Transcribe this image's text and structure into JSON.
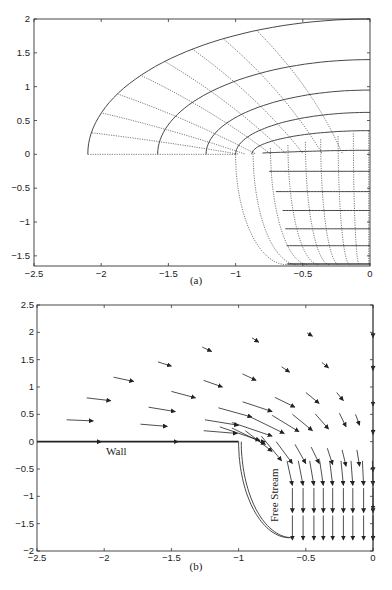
{
  "chart_data": [
    {
      "id": "a",
      "type": "line",
      "title": "",
      "caption": "(a)",
      "xlabel": "",
      "ylabel": "",
      "xlim": [
        -2.5,
        0
      ],
      "ylim": [
        -1.65,
        2
      ],
      "x_ticks": [
        "-2.5",
        "-2",
        "-1.5",
        "-1",
        "-0.5",
        "0"
      ],
      "y_ticks": [
        "-1.5",
        "-1",
        "-0.5",
        "0",
        "0.5",
        "1",
        "1.5",
        "2"
      ],
      "grid": false,
      "description": "Curvilinear orthogonal mesh: solid lines are streamlines (constant psi), dotted lines are equipotentials (constant phi)",
      "solid_curves": [
        {
          "start": [
            -2.1,
            0
          ],
          "end_y_at_x0": 2.0
        },
        {
          "start": [
            -1.58,
            0
          ],
          "end_y_at_x0": 1.4
        },
        {
          "start": [
            -1.22,
            0
          ],
          "end_y_at_x0": 0.95
        },
        {
          "start": [
            -1.0,
            0
          ],
          "end_y_at_x0": 0.62
        },
        {
          "start": [
            -0.88,
            0
          ],
          "end_y_at_x0": 0.35
        },
        {
          "start": [
            -0.8,
            -0.02
          ],
          "end_y_at_x0": 0.02
        },
        {
          "start": [
            -0.75,
            -0.25
          ],
          "end_y_at_x0": -0.25
        },
        {
          "start": [
            -0.7,
            -0.55
          ],
          "end_y_at_x0": -0.55
        },
        {
          "start": [
            -0.65,
            -0.83
          ],
          "end_y_at_x0": -0.83
        },
        {
          "start": [
            -0.63,
            -1.1
          ],
          "end_y_at_x0": -1.1
        },
        {
          "start": [
            -0.62,
            -1.35
          ],
          "end_y_at_x0": -1.35
        },
        {
          "start": [
            -0.61,
            -1.62
          ],
          "end_y_at_x0": -1.62
        }
      ],
      "dotted_curves_bottom_x": [
        -0.62,
        -0.54,
        -0.46,
        -0.38,
        -0.3,
        -0.23,
        -0.15,
        -0.08,
        -0.01
      ],
      "dotted_rays_angle_deg": [
        0,
        15,
        30,
        45,
        60
      ]
    },
    {
      "id": "b",
      "type": "scatter",
      "subtype": "quiver",
      "title": "",
      "caption": "(b)",
      "xlabel": "",
      "ylabel": "",
      "xlim": [
        -2.5,
        0
      ],
      "ylim": [
        -2,
        2.5
      ],
      "x_ticks": [
        "-2.5",
        "-2",
        "-1.5",
        "-1",
        "-0.5",
        "0"
      ],
      "y_ticks": [
        "-2",
        "-1.5",
        "-1",
        "-0.5",
        "0",
        "0.5",
        "1",
        "1.5",
        "2",
        "2.5"
      ],
      "grid": false,
      "annotations": [
        {
          "text": "Wall",
          "x": -2.05,
          "y": -0.15,
          "rotation": 0
        },
        {
          "text": "Free Stream",
          "x": -0.72,
          "y": -1.2,
          "rotation": -90
        }
      ],
      "wall_line": {
        "x": [
          -2.5,
          -1.0
        ],
        "y": [
          0,
          0
        ]
      },
      "free_stream_curve": "quarter curve from (-1.0, 0) bending down to (-0.62, -1.85)",
      "arrows": [
        {
          "x": -2.08,
          "y": 0.38,
          "u": 0.2,
          "v": -0.02
        },
        {
          "x": -1.95,
          "y": 0.75,
          "u": 0.18,
          "v": -0.05
        },
        {
          "x": -1.78,
          "y": 1.1,
          "u": 0.15,
          "v": -0.08
        },
        {
          "x": -1.5,
          "y": 1.38,
          "u": 0.1,
          "v": -0.08
        },
        {
          "x": -1.2,
          "y": 1.65,
          "u": 0.07,
          "v": -0.08
        },
        {
          "x": -0.85,
          "y": 1.82,
          "u": 0.05,
          "v": -0.08
        },
        {
          "x": -0.45,
          "y": 1.93,
          "u": 0.04,
          "v": -0.06
        },
        {
          "x": -1.53,
          "y": 0.28,
          "u": 0.2,
          "v": -0.04
        },
        {
          "x": -1.47,
          "y": 0.55,
          "u": 0.2,
          "v": -0.08
        },
        {
          "x": -1.32,
          "y": 0.8,
          "u": 0.18,
          "v": -0.12
        },
        {
          "x": -1.12,
          "y": 1.0,
          "u": 0.14,
          "v": -0.12
        },
        {
          "x": -0.87,
          "y": 1.12,
          "u": 0.1,
          "v": -0.12
        },
        {
          "x": -0.62,
          "y": 1.27,
          "u": 0.06,
          "v": -0.1
        },
        {
          "x": -0.33,
          "y": 1.35,
          "u": 0.05,
          "v": -0.1
        },
        {
          "x": -1.01,
          "y": 0.15,
          "u": 0.25,
          "v": -0.05
        },
        {
          "x": -1.0,
          "y": 0.3,
          "u": 0.25,
          "v": -0.1
        },
        {
          "x": -0.9,
          "y": 0.45,
          "u": 0.25,
          "v": -0.17
        },
        {
          "x": -0.75,
          "y": 0.55,
          "u": 0.22,
          "v": -0.18
        },
        {
          "x": -0.58,
          "y": 0.63,
          "u": 0.15,
          "v": -0.18
        },
        {
          "x": -0.4,
          "y": 0.7,
          "u": 0.1,
          "v": -0.2
        },
        {
          "x": -0.22,
          "y": 0.75,
          "u": 0.05,
          "v": -0.15
        },
        {
          "x": -0.84,
          "y": 0.02,
          "u": 0.3,
          "v": -0.25
        },
        {
          "x": -0.75,
          "y": 0.1,
          "u": 0.3,
          "v": -0.25
        },
        {
          "x": -0.66,
          "y": 0.15,
          "u": 0.25,
          "v": -0.3
        },
        {
          "x": -0.55,
          "y": 0.18,
          "u": 0.2,
          "v": -0.3
        },
        {
          "x": -0.45,
          "y": 0.2,
          "u": 0.15,
          "v": -0.3
        },
        {
          "x": -0.33,
          "y": 0.23,
          "u": 0.1,
          "v": -0.28
        },
        {
          "x": -0.2,
          "y": 0.27,
          "u": 0.05,
          "v": -0.25
        },
        {
          "x": -0.1,
          "y": 0.3,
          "u": 0.03,
          "v": -0.2
        },
        {
          "x": -0.8,
          "y": -0.05,
          "u": 0.25,
          "v": -0.3
        },
        {
          "x": -0.75,
          "y": -0.18,
          "u": 0.2,
          "v": -0.38
        },
        {
          "x": -0.68,
          "y": -0.35,
          "u": 0.15,
          "v": -0.45
        },
        {
          "x": -0.6,
          "y": -0.4,
          "u": 0.12,
          "v": -0.4
        },
        {
          "x": -0.5,
          "y": -0.4,
          "u": 0.08,
          "v": -0.35
        },
        {
          "x": -0.4,
          "y": -0.4,
          "u": 0.06,
          "v": -0.3
        },
        {
          "x": -0.3,
          "y": -0.42,
          "u": 0.04,
          "v": -0.3
        },
        {
          "x": -0.2,
          "y": -0.45,
          "u": 0.03,
          "v": -0.3
        },
        {
          "x": -0.1,
          "y": -0.45,
          "u": 0.02,
          "v": -0.3
        },
        {
          "x": 0.0,
          "y": 1.9,
          "u": 0,
          "v": -0.1
        },
        {
          "x": 0.0,
          "y": 1.3,
          "u": 0,
          "v": -0.1
        },
        {
          "x": 0.0,
          "y": 0.65,
          "u": 0,
          "v": -0.1
        },
        {
          "x": 0.0,
          "y": 0.13,
          "u": 0,
          "v": -0.1
        },
        {
          "x": 0.0,
          "y": -0.55,
          "u": 0,
          "v": -0.1
        },
        {
          "x": 0.0,
          "y": -1.25,
          "u": 0,
          "v": -0.1
        },
        {
          "x": 0.0,
          "y": -1.8,
          "u": 0,
          "v": -0.1
        }
      ],
      "grid_arrows_lower": {
        "x": [
          -0.6,
          -0.52,
          -0.44,
          -0.37,
          -0.3,
          -0.22,
          -0.15,
          -0.07,
          0.0
        ],
        "rows_y_tip": [
          -0.8,
          -1.3,
          -1.8
        ],
        "length": 0.45
      }
    }
  ],
  "panel_a": {
    "caption": "(a)",
    "x_ticks": [
      "-2.5",
      "-2",
      "-1.5",
      "-1",
      "-0.5",
      "0"
    ],
    "y_ticks": [
      "-1.5",
      "-1",
      "-0.5",
      "0",
      "0.5",
      "1",
      "1.5",
      "2"
    ]
  },
  "panel_b": {
    "caption": "(b)",
    "x_ticks": [
      "-2.5",
      "-2",
      "-1.5",
      "-1",
      "-0.5",
      "0"
    ],
    "y_ticks": [
      "-2",
      "-1.5",
      "-1",
      "-0.5",
      "0",
      "0.5",
      "1",
      "1.5",
      "2",
      "2.5"
    ],
    "wall_label": "Wall",
    "free_stream_label": "Free Stream"
  }
}
